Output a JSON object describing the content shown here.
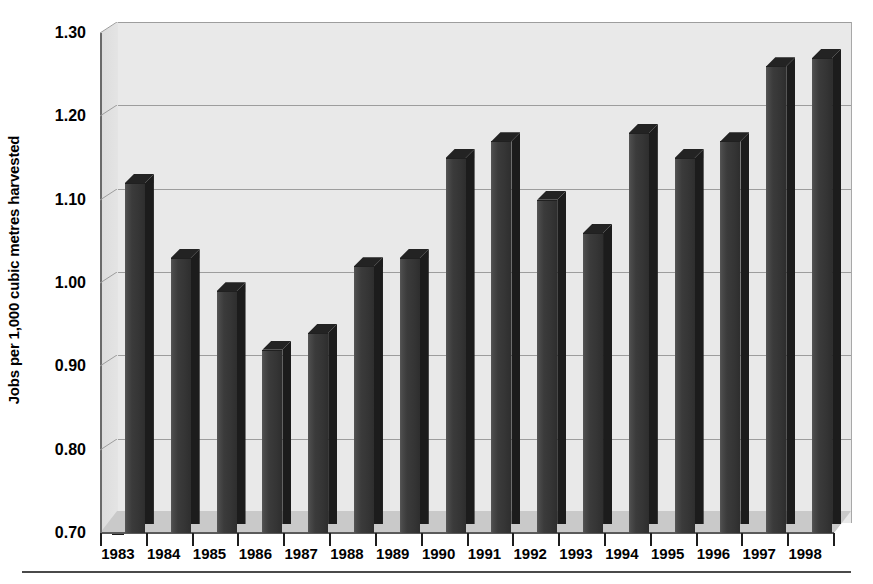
{
  "chart_data": {
    "type": "bar",
    "title": "",
    "xlabel": "",
    "ylabel": "Jobs per 1,000 cubic metres harvested",
    "categories": [
      "1983",
      "1984",
      "1985",
      "1986",
      "1987",
      "1988",
      "1989",
      "1990",
      "1991",
      "1992",
      "1993",
      "1994",
      "1995",
      "1996",
      "1997",
      "1998"
    ],
    "values": [
      1.12,
      1.03,
      0.99,
      0.92,
      0.94,
      1.02,
      1.03,
      1.15,
      1.17,
      1.1,
      1.06,
      1.18,
      1.15,
      1.17,
      1.26,
      1.27
    ],
    "ylim": [
      0.7,
      1.3
    ],
    "ytick_labels": [
      "1.30",
      "1.20",
      "1.10",
      "1.00",
      "0.90",
      "0.80",
      "0.70"
    ],
    "ytick_values": [
      1.3,
      1.2,
      1.1,
      1.0,
      0.9,
      0.8,
      0.7
    ],
    "grid": true,
    "legend": "none",
    "style": "3d-columns",
    "colors": {
      "bar_front": "#3b3b3b",
      "bar_side": "#1c1c1c",
      "bar_top": "#232323",
      "plot_background": "#e9e9e9",
      "gridline": "#9d9d9d",
      "floor": "#c9c9c9",
      "text": "#000000"
    }
  }
}
